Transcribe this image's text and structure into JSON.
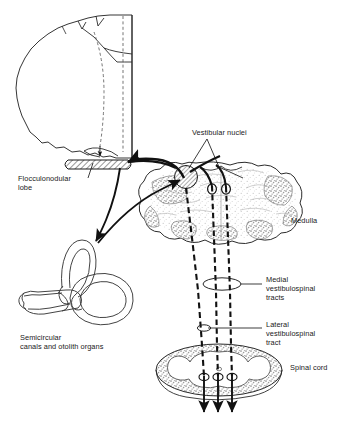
{
  "figure": {
    "background_color": "#ffffff",
    "ink_color": "#1a1a1a",
    "gray_matter_color": "#9a9a9a"
  },
  "labels": {
    "vestibular_nuclei": "Vestibular nuclei",
    "flocculonodular_lobe_line1": "Flocculonodular",
    "flocculonodular_lobe_line2": "lobe",
    "medulla": "Medulla",
    "medial_tract_line1": "Medial",
    "medial_tract_line2": "vestibulospinal",
    "medial_tract_line3": "tracts",
    "lateral_tract_line1": "Lateral",
    "lateral_tract_line2": "vestibulospinal",
    "lateral_tract_line3": "tract",
    "spinal_cord": "Spinal cord",
    "semicircular_line1": "Semicircular",
    "semicircular_line2": "canals and otolith organs"
  },
  "structures": [
    {
      "name": "cerebellum",
      "label": "Cerebellum (sagittal outline)"
    },
    {
      "name": "flocculonodular-lobe",
      "label": "Flocculonodular lobe (hatched)"
    },
    {
      "name": "labyrinth",
      "label": "Semicircular canals and otolith organs"
    },
    {
      "name": "medulla-section",
      "label": "Medulla cross-section"
    },
    {
      "name": "spinal-cord-section",
      "label": "Spinal cord cross-section"
    },
    {
      "name": "vestibular-nuclei-marker",
      "label": "Vestibular nuclei (hatched circle)"
    }
  ],
  "pathways": [
    {
      "name": "lateral-vestibulospinal-tract",
      "style": "dashed",
      "count": 1
    },
    {
      "name": "medial-vestibulospinal-tracts",
      "style": "dashed-pair",
      "count": 2
    },
    {
      "name": "labyrinth-to-nuclei-afferent",
      "style": "curved-arrow"
    },
    {
      "name": "nuclei-to-flocculonodular-afferent",
      "style": "curved-arrow"
    }
  ],
  "markers": {
    "medial_callout": "ellipse around medial tracts",
    "lateral_callout": "small ellipse on lateral tract",
    "terminal_arrows": 3
  }
}
